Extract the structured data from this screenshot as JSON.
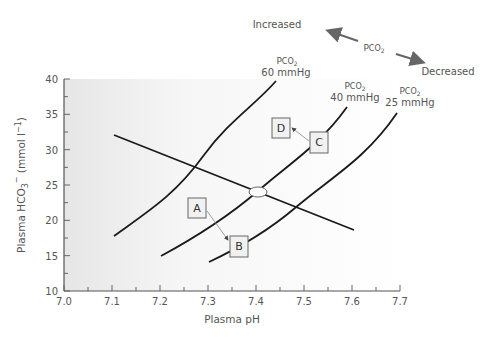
{
  "chart_data": {
    "type": "line",
    "title": "",
    "xlabel": "Plasma pH",
    "ylabel": "Plasma HCO3⁻ (mmol l⁻¹)",
    "xlim": [
      7.0,
      7.7
    ],
    "ylim": [
      10,
      40
    ],
    "x_ticks": [
      "7.0",
      "7.1",
      "7.2",
      "7.3",
      "7.4",
      "7.5",
      "7.6",
      "7.7"
    ],
    "y_ticks": [
      "10",
      "15",
      "20",
      "25",
      "30",
      "35",
      "40"
    ],
    "grid": false,
    "series": [
      {
        "name": "PCO2 60 mmHg",
        "label_line1": "Pco₂",
        "label_line2": "60 mmHg",
        "points": [
          [
            7.1,
            17.8
          ],
          [
            7.2,
            22.1
          ],
          [
            7.28,
            27.0
          ],
          [
            7.35,
            33.0
          ],
          [
            7.445,
            39.7
          ]
        ]
      },
      {
        "name": "PCO2 40 mmHg",
        "label_line1": "Pco₂",
        "label_line2": "40 mmHg",
        "points": [
          [
            7.2,
            15.0
          ],
          [
            7.3,
            18.8
          ],
          [
            7.4,
            24.0
          ],
          [
            7.5,
            30.5
          ],
          [
            7.59,
            36.1
          ]
        ]
      },
      {
        "name": "PCO2 25 mmHg",
        "label_line1": "Pco₂",
        "label_line2": "25 mmHg",
        "points": [
          [
            7.3,
            14.1
          ],
          [
            7.4,
            17.3
          ],
          [
            7.48,
            21.8
          ],
          [
            7.6,
            28.5
          ],
          [
            7.69,
            35.2
          ]
        ]
      },
      {
        "name": "Buffer line",
        "points": [
          [
            7.1,
            32.0
          ],
          [
            7.4,
            24.0
          ],
          [
            7.6,
            18.5
          ]
        ]
      }
    ],
    "annotations": [
      {
        "label": "A",
        "x": 7.27,
        "y": 17.3
      },
      {
        "label": "B",
        "x": 7.36,
        "y": 15.3
      },
      {
        "label": "C",
        "x": 7.53,
        "y": 31.3
      },
      {
        "label": "D",
        "x": 7.45,
        "y": 32.6
      },
      {
        "label": "normal point (ellipse)",
        "x": 7.4,
        "y": 24.0
      }
    ],
    "arrows": [
      {
        "from": "A",
        "to": "B"
      },
      {
        "from": "C",
        "to": "D"
      }
    ],
    "legend": {
      "increased_label": "Increased",
      "decreased_label": "Decreased",
      "center_label": "Pco₂"
    }
  }
}
